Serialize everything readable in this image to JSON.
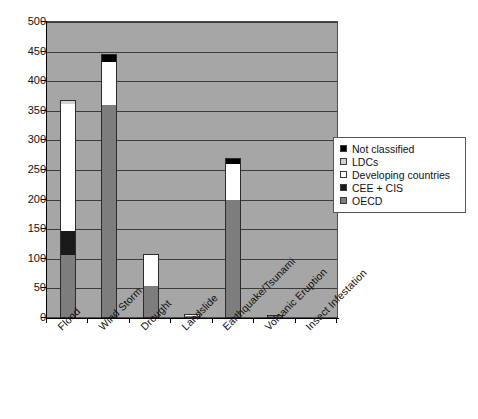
{
  "chart_data": {
    "type": "bar",
    "subtype": "stacked-bar",
    "title": "",
    "xlabel": "",
    "ylabel": "",
    "ylim": [
      0,
      500
    ],
    "ytick_step": 50,
    "yticks": [
      0,
      50,
      100,
      150,
      200,
      250,
      300,
      350,
      400,
      450,
      500
    ],
    "grid": true,
    "grid_axis": "y",
    "legend_position": "right",
    "categories": [
      "Flood",
      "Wind Storm",
      "Drought",
      "Landslide",
      "Earthquake/Tsunami",
      "Volcanic Eruption",
      "Insect Infestation"
    ],
    "series": [
      {
        "name": "OECD",
        "color": "#7d7d7d",
        "values": [
          105,
          358,
          53,
          2,
          198,
          2,
          0
        ]
      },
      {
        "name": "CEE + CIS",
        "color": "#1a1a1a",
        "values": [
          40,
          0,
          0,
          0,
          0,
          0,
          0
        ]
      },
      {
        "name": "Developing countries",
        "color": "#ffffff",
        "values": [
          215,
          73,
          52,
          1,
          60,
          0,
          0
        ]
      },
      {
        "name": "LDCs",
        "color": "#d2d2d2",
        "values": [
          5,
          0,
          0,
          0,
          0,
          0,
          0
        ]
      },
      {
        "name": "Not classified",
        "color": "#000000",
        "values": [
          0,
          11,
          0,
          0,
          9,
          0,
          0
        ]
      }
    ],
    "totals": [
      365,
      442,
      105,
      3,
      267,
      2,
      0
    ],
    "stack_order_bottom_to_top": [
      "OECD",
      "CEE + CIS",
      "Developing countries",
      "LDCs",
      "Not classified"
    ],
    "plot_background_color": "#a6a6a6",
    "gridline_color": "#3b3b3b"
  },
  "legend": {
    "entries": [
      {
        "label": "Not classified",
        "color": "#000000"
      },
      {
        "label": "LDCs",
        "color": "#d2d2d2"
      },
      {
        "label": "Developing countries",
        "color": "#ffffff"
      },
      {
        "label": "CEE + CIS",
        "color": "#1a1a1a"
      },
      {
        "label": "OECD",
        "color": "#7d7d7d"
      }
    ]
  }
}
